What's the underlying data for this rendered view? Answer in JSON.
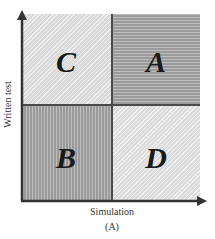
{
  "diagram": {
    "type": "2x2 quadrant matrix",
    "x_axis_label": "Simulation",
    "y_axis_label": "Written test",
    "panel_label": "(A)",
    "quadrants": {
      "top_left": {
        "label": "C",
        "fill": "light gray diagonal hatch",
        "color": "#d9d9d9"
      },
      "top_right": {
        "label": "A",
        "fill": "dark gray horizontal stripes",
        "color": "#9a9a9a"
      },
      "bottom_left": {
        "label": "B",
        "fill": "dark gray vertical stripes",
        "color": "#9a9a9a"
      },
      "bottom_right": {
        "label": "D",
        "fill": "light gray diagonal hatch",
        "color": "#dcdcdc"
      }
    },
    "axis_color": "#333333"
  }
}
